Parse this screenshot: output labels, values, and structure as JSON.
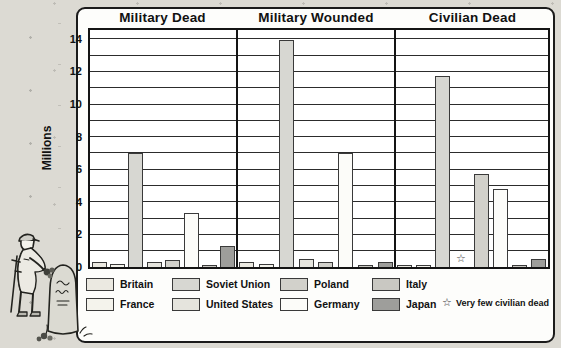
{
  "chart_data": {
    "type": "bar",
    "group_titles": [
      "Military Dead",
      "Military Wounded",
      "Civilian Dead"
    ],
    "ylabel": "Millions",
    "ylim": [
      0,
      14.5
    ],
    "yticks": [
      0,
      2,
      4,
      6,
      8,
      10,
      12,
      14
    ],
    "grid": "horizontal, every 1 million",
    "legend_position": "bottom, two rows",
    "categories": [
      "Britain",
      "France",
      "Soviet Union",
      "United States",
      "Poland",
      "Germany",
      "Italy",
      "Japan"
    ],
    "series": [
      {
        "name": "Military Dead",
        "values": [
          0.3,
          0.2,
          7.0,
          0.3,
          0.4,
          3.3,
          0.1,
          1.3
        ]
      },
      {
        "name": "Military Wounded",
        "values": [
          0.3,
          0.2,
          13.9,
          0.5,
          0.3,
          7.0,
          0.1,
          0.3
        ]
      },
      {
        "name": "Civilian Dead",
        "values": [
          0.1,
          0.1,
          11.7,
          null,
          5.7,
          4.8,
          0.1,
          0.5
        ]
      }
    ],
    "annotations": [
      {
        "symbol": "star",
        "text": "Very few civilian dead",
        "applies_to": "United States, Civilian Dead panel"
      }
    ]
  },
  "colors": {
    "Britain": "#ebe9e1",
    "France": "#f4f3ec",
    "Soviet Union": "#d7d7d2",
    "United States": "#e5e4dd",
    "Poland": "#d2d1cb",
    "Germany": "#fcfcf9",
    "Italy": "#c9c8c2",
    "Japan": "#9e9e9b",
    "bar_border": "#3a3a3a",
    "panel_background": "#ffffff",
    "page_background": "#dcdad3"
  },
  "legend": {
    "rows": [
      [
        {
          "label": "Britain"
        },
        {
          "label": "Soviet Union"
        },
        {
          "label": "Poland"
        },
        {
          "label": "Italy"
        }
      ],
      [
        {
          "label": "France"
        },
        {
          "label": "United States"
        },
        {
          "label": "Germany"
        },
        {
          "label": "Japan"
        }
      ]
    ],
    "note": {
      "symbol": "☆",
      "text": "Very few civilian dead"
    }
  },
  "illustration": {
    "name": "soldier-gravestone-illustration",
    "depicts": "Soldier with crutch laying flowers at a gravestone"
  }
}
